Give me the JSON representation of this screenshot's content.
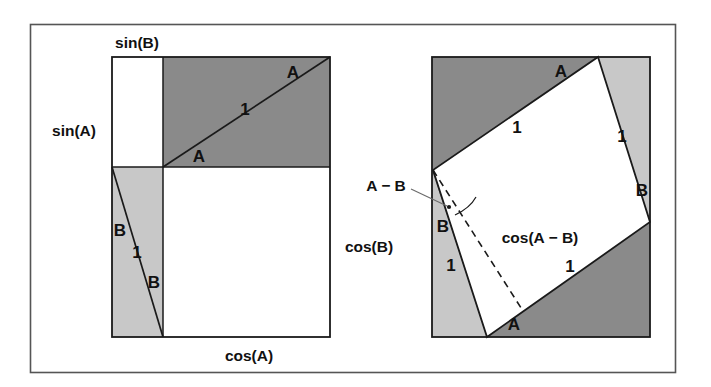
{
  "figure": {
    "colors": {
      "dark_gray": "#8a8a8a",
      "light_gray": "#c8c8c8",
      "white": "#ffffff",
      "stroke": "#1a1a1a",
      "frame": "#555555"
    },
    "frame": {
      "x": 30,
      "y": 24,
      "width": 645,
      "height": 348
    }
  },
  "left_diagram": {
    "name": "unit-square-decomposition",
    "square": {
      "x": 112,
      "y": 57,
      "width": 218,
      "height": 280
    },
    "divisions": {
      "vertical_x": 163,
      "horizontal_y": 167
    },
    "labels": {
      "sin_b": "sin(B)",
      "sin_a": "sin(A)",
      "cos_b": "cos(B)",
      "cos_a": "cos(A)",
      "angle_a_top": "A",
      "angle_a_bottom": "A",
      "hyp_top": "1",
      "angle_b_top": "B",
      "angle_b_bottom": "B",
      "hyp_bottom": "1"
    }
  },
  "right_diagram": {
    "name": "rotated-unit-square",
    "square": {
      "x": 432,
      "y": 57,
      "width": 218,
      "height": 280
    },
    "rotated_vertices": [
      {
        "x": 598,
        "y": 57
      },
      {
        "x": 650,
        "y": 222
      },
      {
        "x": 487,
        "y": 337
      },
      {
        "x": 433,
        "y": 170
      }
    ],
    "labels": {
      "angle_a_top": "A",
      "hyp_top_left": "1",
      "hyp_top_right": "1",
      "angle_b_right": "B",
      "angle_diff": "A − B",
      "angle_b_left": "B",
      "hyp_bottom_left": "1",
      "cos_diff": "cos(A − B)",
      "hyp_bottom_right": "1",
      "angle_a_bottom": "A"
    }
  }
}
